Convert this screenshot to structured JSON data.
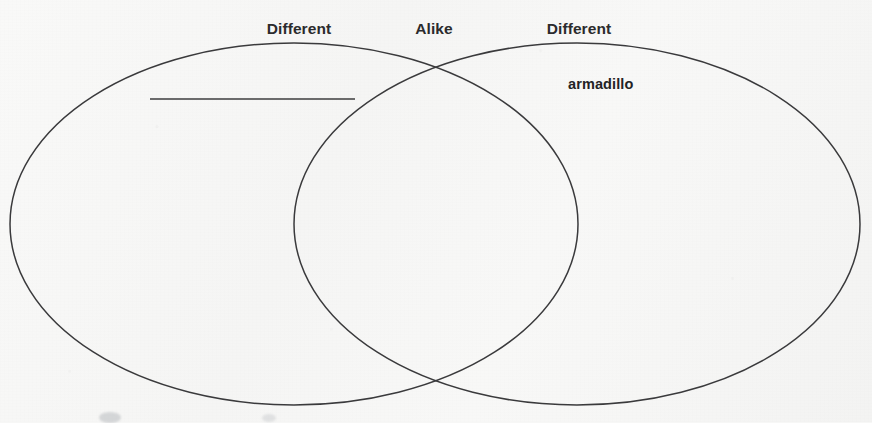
{
  "worksheet": {
    "type": "venn-diagram-worksheet",
    "headings": [
      {
        "text": "Different",
        "x": 299,
        "y": 20,
        "region": "left-only"
      },
      {
        "text": "Alike",
        "x": 434,
        "y": 20,
        "region": "intersection"
      },
      {
        "text": "Different",
        "x": 579,
        "y": 20,
        "region": "right-only"
      }
    ],
    "entries": [
      {
        "text": "armadillo",
        "x": 568,
        "y": 76,
        "region": "right-only"
      }
    ],
    "answer_lines": [
      {
        "x1": 150,
        "y1": 99,
        "x2": 355,
        "y2": 99,
        "region": "left-only"
      }
    ],
    "circles": [
      {
        "name": "left-circle",
        "cx": 294,
        "cy": 224,
        "rx": 284,
        "ry": 181
      },
      {
        "name": "right-circle",
        "cx": 577,
        "cy": 224,
        "rx": 283,
        "ry": 181
      }
    ],
    "colors": {
      "background": "#f6f6f5",
      "outline": "#3a3a3c",
      "heading_text": "#2b2b2d",
      "entry_text": "#232325",
      "rule_line": "#3c3c3e"
    }
  }
}
